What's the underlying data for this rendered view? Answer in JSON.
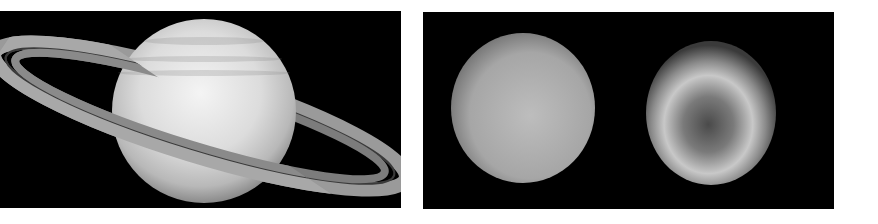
{
  "figure": {
    "panels": [
      {
        "id": "left",
        "subject": "Saturn",
        "description": "Ringed gas giant with banded atmosphere, rings tilted diagonally"
      },
      {
        "id": "right",
        "subject": "Two ice giant planets",
        "bodies": [
          {
            "name": "Uranus",
            "description": "Featureless pale sphere"
          },
          {
            "name": "Neptune",
            "description": "Sphere with bright ring band and dark central spot"
          }
        ]
      }
    ],
    "colors": {
      "background": "#ffffff",
      "space": "#000000",
      "planet_light": "#e8e8e8",
      "planet_mid": "#a0a0a0"
    }
  }
}
